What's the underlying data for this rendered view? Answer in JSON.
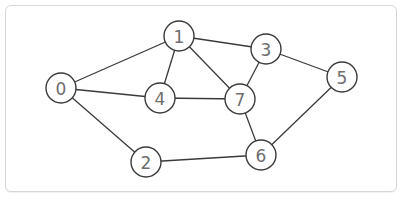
{
  "graph": {
    "nodes": [
      {
        "id": "0",
        "label": "0",
        "x": 61,
        "y": 88
      },
      {
        "id": "1",
        "label": "1",
        "x": 179,
        "y": 36
      },
      {
        "id": "2",
        "label": "2",
        "x": 146,
        "y": 162
      },
      {
        "id": "3",
        "label": "3",
        "x": 266,
        "y": 49
      },
      {
        "id": "4",
        "label": "4",
        "x": 160,
        "y": 98
      },
      {
        "id": "5",
        "label": "5",
        "x": 342,
        "y": 77
      },
      {
        "id": "6",
        "label": "6",
        "x": 261,
        "y": 155
      },
      {
        "id": "7",
        "label": "7",
        "x": 240,
        "y": 99
      }
    ],
    "edges": [
      [
        "0",
        "1"
      ],
      [
        "0",
        "4"
      ],
      [
        "0",
        "2"
      ],
      [
        "1",
        "3"
      ],
      [
        "1",
        "4"
      ],
      [
        "1",
        "7"
      ],
      [
        "3",
        "7"
      ],
      [
        "3",
        "5"
      ],
      [
        "4",
        "7"
      ],
      [
        "7",
        "6"
      ],
      [
        "5",
        "6"
      ],
      [
        "2",
        "6"
      ]
    ],
    "node_radius": 15
  }
}
